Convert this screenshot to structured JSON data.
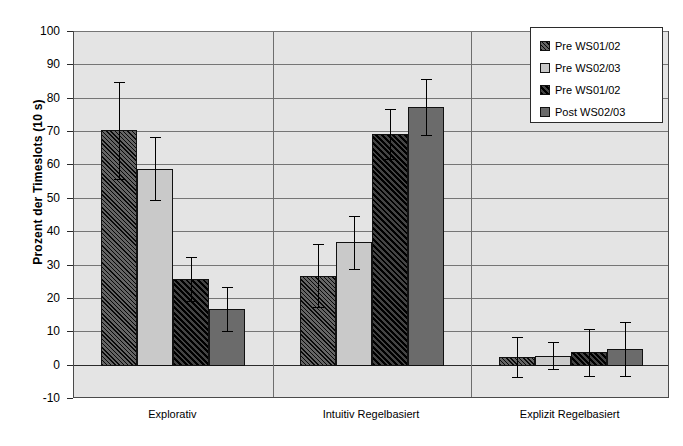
{
  "chart_data": {
    "type": "bar",
    "title": "",
    "xlabel": "",
    "ylabel": "Prozent der Timeslots (10 s)",
    "categories": [
      "Explorativ",
      "Intuitiv Regelbasiert",
      "Explizit Regelbasiert"
    ],
    "ylim": [
      -10,
      100
    ],
    "yticks": [
      100,
      90,
      80,
      70,
      60,
      50,
      40,
      30,
      20,
      10,
      0,
      -10
    ],
    "grid": true,
    "legend_position": "top-right",
    "series": [
      {
        "name": "Pre WS01/02",
        "fill": "hatched-dark",
        "color": "#3a3a3a",
        "values": [
          70.5,
          27.0,
          2.5
        ],
        "errors": [
          14.5,
          9.5,
          6.0
        ]
      },
      {
        "name": "Pre WS02/03",
        "fill": "solid-light-gray",
        "color": "#c9c9c9",
        "values": [
          59.0,
          37.0,
          3.0
        ],
        "errors": [
          9.5,
          8.0,
          4.0
        ]
      },
      {
        "name": "Pre WS01/02",
        "fill": "hatched-black",
        "color": "#0d0d0d",
        "values": [
          26.0,
          69.5,
          4.0
        ],
        "errors": [
          6.5,
          7.5,
          7.0
        ]
      },
      {
        "name": "Post WS02/03",
        "fill": "solid-mid-gray",
        "color": "#6b6b6b",
        "values": [
          17.0,
          77.5,
          5.0
        ],
        "errors": [
          6.5,
          8.5,
          8.0
        ]
      }
    ]
  },
  "axis": {
    "y_title": "Prozent der Timeslots (10 s)",
    "y_tick_labels": [
      "100",
      "90",
      "80",
      "70",
      "60",
      "50",
      "40",
      "30",
      "20",
      "10",
      "0",
      "-10"
    ],
    "x_tick_labels": [
      "Explorativ",
      "Intuitiv Regelbasiert",
      "Explizit Regelbasiert"
    ]
  },
  "legend": {
    "items": [
      {
        "label": "Pre WS01/02"
      },
      {
        "label": "Pre WS02/03"
      },
      {
        "label": "Pre WS01/02"
      },
      {
        "label": "Post WS02/03"
      }
    ]
  },
  "colors": {
    "plot_background": "#e4e4e4",
    "gridline": "#757575",
    "axis": "#2b2b2b",
    "series1": "#3a3a3a",
    "series2": "#c9c9c9",
    "series3": "#0d0d0d",
    "series4": "#6b6b6b"
  }
}
